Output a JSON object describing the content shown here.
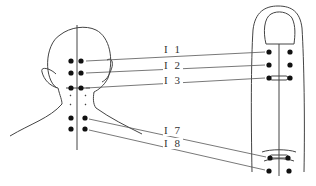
{
  "diagram": {
    "type": "acupoint correspondence diagram",
    "left_figure": "back of head and neck",
    "right_figure": "finger (palmar/dorsal view with nail)",
    "line_color": "#555555",
    "dot_color": "#111111",
    "labels": [
      {
        "id": "I1",
        "text": "I 1",
        "x": 163,
        "y": 49
      },
      {
        "id": "I2",
        "text": "I 2",
        "x": 163,
        "y": 65
      },
      {
        "id": "I3",
        "text": "I 3",
        "x": 163,
        "y": 80
      },
      {
        "id": "I7",
        "text": "I 7",
        "x": 163,
        "y": 130
      },
      {
        "id": "I8",
        "text": "I 8",
        "x": 163,
        "y": 143
      }
    ]
  }
}
